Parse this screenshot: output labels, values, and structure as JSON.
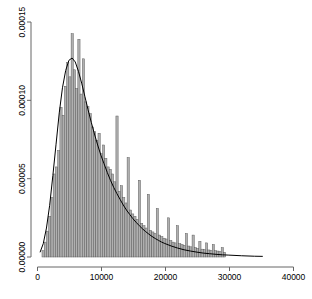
{
  "chart_data": {
    "type": "bar",
    "title": "",
    "subtitle": "",
    "xlabel": "",
    "ylabel": "",
    "grid": false,
    "legend": "none",
    "xlim": [
      0,
      40000
    ],
    "ylim": [
      0,
      0.00015
    ],
    "xticks": [
      0,
      10000,
      20000,
      30000,
      40000
    ],
    "xticklabels": [
      "0",
      "10000",
      "20000",
      "30000",
      "40000"
    ],
    "yticks": [
      0.0,
      5e-05,
      0.0001,
      0.00015
    ],
    "yticklabels": [
      "0.00000",
      "0.00005",
      "0.00010",
      "0.00015"
    ],
    "bin_width": 350,
    "bar_fill": "#b0b0b0",
    "bar_stroke": "#555555",
    "density_stroke": "#000000",
    "axis_color": "#666666",
    "background": "#ffffff",
    "bin_starts": [
      700,
      1050,
      1400,
      1750,
      2100,
      2450,
      2800,
      3150,
      3500,
      3850,
      4200,
      4550,
      4900,
      5250,
      5600,
      5950,
      6300,
      6650,
      7000,
      7350,
      7700,
      8050,
      8400,
      8750,
      9100,
      9450,
      9800,
      10150,
      10500,
      10850,
      11200,
      11550,
      11900,
      12250,
      12600,
      12950,
      13300,
      13650,
      14000,
      14350,
      14700,
      15050,
      15400,
      15750,
      16100,
      16450,
      16800,
      17150,
      17500,
      17850,
      18200,
      18550,
      18900,
      19250,
      19600,
      19950,
      20300,
      20650,
      21000,
      21350,
      21700,
      22050,
      22400,
      22750,
      23100,
      23450,
      23800,
      24150,
      24500,
      24850,
      25200,
      25550,
      25900,
      26250,
      26600,
      26950,
      27300,
      27650,
      28000,
      28350,
      28700,
      29050
    ],
    "values": [
      4e-06,
      9.5e-06,
      1.65e-05,
      2.6e-05,
      3.8e-05,
      5.3e-05,
      5.75e-05,
      6.8e-05,
      9.55e-05,
      9.05e-05,
      0.000109,
      0.000124,
      0.000115,
      0.0001425,
      0.0001195,
      0.0001075,
      0.000139,
      0.000104,
      0.0001265,
      9.9e-05,
      9.6e-05,
      9.15e-05,
      8.3e-05,
      8e-05,
      7.45e-05,
      7.9e-05,
      6.6e-05,
      7.15e-05,
      6.3e-05,
      5.75e-05,
      5.6e-05,
      5.3e-05,
      4.8e-05,
      9e-05,
      4.2e-05,
      4.55e-05,
      3.8e-05,
      3.45e-05,
      6.35e-05,
      3e-05,
      2.75e-05,
      2.6e-05,
      2.4e-05,
      4.9e-05,
      2.15e-05,
      2e-05,
      1.85e-05,
      4e-05,
      1.7e-05,
      1.6e-05,
      1.5e-05,
      3.1e-05,
      1.4e-05,
      1.3e-05,
      1.2e-05,
      1.15e-05,
      2.5e-05,
      1.05e-05,
      9.5e-06,
      9e-06,
      2e-05,
      8.5e-06,
      8e-06,
      7.5e-06,
      1.5e-05,
      7e-06,
      6.5e-06,
      1.4e-05,
      6e-06,
      5.5e-06,
      1e-05,
      5e-06,
      4.8e-06,
      9e-06,
      4.5e-06,
      4.2e-06,
      8e-06,
      4e-06,
      3.8e-06,
      3.5e-06,
      6e-06,
      3e-06
    ],
    "density_curve": {
      "x": [
        400,
        900,
        1400,
        1900,
        2400,
        2900,
        3400,
        3900,
        4400,
        4900,
        5400,
        5900,
        6400,
        6900,
        7400,
        7900,
        8400,
        8900,
        9400,
        9900,
        10400,
        10900,
        11400,
        11900,
        12400,
        12900,
        13400,
        13900,
        14400,
        14900,
        15400,
        15900,
        16400,
        16900,
        17400,
        17900,
        18400,
        18900,
        19400,
        19900,
        20900,
        21900,
        22900,
        23900,
        24900,
        25900,
        26900,
        27900,
        28900,
        29900,
        31900,
        33900,
        35200
      ],
      "y": [
        3e-06,
        8.5e-06,
        1.85e-05,
        3.3e-05,
        5.2e-05,
        7.2e-05,
        9.2e-05,
        0.000108,
        0.000119,
        0.0001255,
        0.000127,
        0.0001245,
        0.0001185,
        0.000111,
        0.0001025,
        9.4e-05,
        8.6e-05,
        7.85e-05,
        7.15e-05,
        6.5e-05,
        5.95e-05,
        5.4e-05,
        4.9e-05,
        4.45e-05,
        4.05e-05,
        3.68e-05,
        3.32e-05,
        3e-05,
        2.72e-05,
        2.45e-05,
        2.22e-05,
        2e-05,
        1.8e-05,
        1.62e-05,
        1.46e-05,
        1.31e-05,
        1.18e-05,
        1.06e-05,
        9.5e-06,
        8.6e-06,
        7e-06,
        5.7e-06,
        4.6e-06,
        3.8e-06,
        3.1e-06,
        2.5e-06,
        2.1e-06,
        1.7e-06,
        1.4e-06,
        1.2e-06,
        8e-07,
        5e-07,
        4e-07
      ]
    }
  }
}
